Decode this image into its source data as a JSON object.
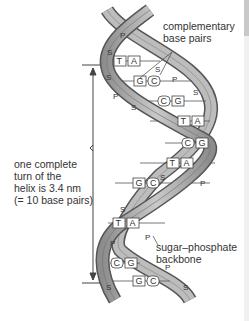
{
  "diagram": {
    "labels": {
      "complementary": [
        "complementary",
        "base pairs"
      ],
      "turn": [
        "one complete",
        "turn of the",
        "helix is 3.4 nm",
        "(= 10 base pairs)"
      ],
      "backbone": [
        "sugar–phosphate",
        "backbone"
      ]
    },
    "backbone_letters": {
      "sugar": "S",
      "phosphate": "P"
    },
    "base_pairs": [
      {
        "left": "T",
        "right": "A"
      },
      {
        "left": "G",
        "right": "C"
      },
      {
        "left": "C",
        "right": "G"
      },
      {
        "left": "T",
        "right": "A"
      },
      {
        "left": "C",
        "right": "G"
      },
      {
        "left": "T",
        "right": "A"
      },
      {
        "left": "G",
        "right": "C"
      },
      {
        "left": "T",
        "right": "A"
      },
      {
        "left": "C",
        "right": "G"
      },
      {
        "left": "G",
        "right": "C"
      }
    ],
    "colors": {
      "strand_fill": "#b5b5b5",
      "strand_edge": "#555555",
      "text": "#333333",
      "background": "#ffffff"
    }
  }
}
